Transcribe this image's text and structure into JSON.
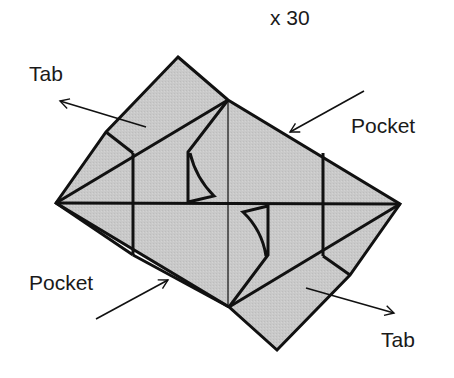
{
  "diagram": {
    "multiplier": "x 30",
    "labels": {
      "tab_top": "Tab",
      "pocket_top": "Pocket",
      "pocket_bottom": "Pocket",
      "tab_bottom": "Tab"
    },
    "colors": {
      "paper_fill": "#c8c8c8",
      "line": "#111111",
      "background": "#ffffff"
    }
  }
}
